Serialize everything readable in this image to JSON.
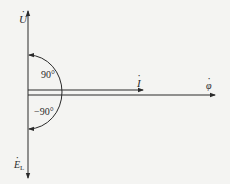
{
  "diagram": {
    "type": "phasor-diagram",
    "colors": {
      "background": "#f4f4f2",
      "stroke": "#2a2a2a"
    },
    "axes": {
      "vertical_top_label": {
        "symbol": "U",
        "dotted": true
      },
      "vertical_bottom_label": {
        "symbol": "E",
        "subscript": "L",
        "dotted": true
      },
      "horizontal_label": {
        "symbol": "φ",
        "dotted": true
      }
    },
    "phasors": [
      {
        "symbol": "I",
        "dotted": true,
        "direction": "right",
        "angle_deg": 0
      }
    ],
    "angles": [
      {
        "label": "90°",
        "from": "I",
        "to": "U",
        "direction": "counter-clockwise"
      },
      {
        "label": "−90°",
        "from": "I",
        "to": "E_L",
        "direction": "clockwise"
      }
    ]
  }
}
